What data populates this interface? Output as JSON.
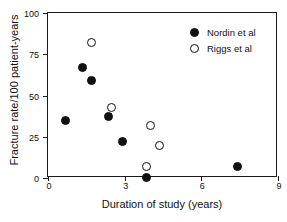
{
  "chart_data": {
    "type": "scatter",
    "title": "",
    "xlabel": "Duration of study (years)",
    "ylabel": "Fracture rate/100 patient-years",
    "xlim": [
      0,
      9
    ],
    "ylim": [
      0,
      100
    ],
    "xticks": [
      "0",
      "3",
      "6",
      "9"
    ],
    "xtick_values": [
      0,
      3,
      6,
      9
    ],
    "yticks": [
      "0",
      "25",
      "50",
      "75",
      "100"
    ],
    "ytick_values": [
      0,
      25,
      50,
      75,
      100
    ],
    "grid": false,
    "legend_position": "top-right",
    "series": [
      {
        "name": "Nordin et al",
        "marker": "filled-circle",
        "color": "#111111",
        "points": [
          {
            "x": 0.7,
            "y": 35
          },
          {
            "x": 1.35,
            "y": 67
          },
          {
            "x": 1.7,
            "y": 59
          },
          {
            "x": 2.35,
            "y": 37
          },
          {
            "x": 2.9,
            "y": 22
          },
          {
            "x": 3.85,
            "y": 0.5
          },
          {
            "x": 7.4,
            "y": 7
          }
        ]
      },
      {
        "name": "Riggs et al",
        "marker": "open-circle",
        "color": "#111111",
        "points": [
          {
            "x": 1.7,
            "y": 82
          },
          {
            "x": 2.5,
            "y": 43
          },
          {
            "x": 3.85,
            "y": 7
          },
          {
            "x": 4.0,
            "y": 32
          },
          {
            "x": 4.35,
            "y": 20
          }
        ]
      }
    ]
  },
  "legend": {
    "entries": [
      {
        "label": "Nordin et al",
        "marker": "filled-circle"
      },
      {
        "label": "Riggs et al",
        "marker": "open-circle"
      }
    ]
  }
}
